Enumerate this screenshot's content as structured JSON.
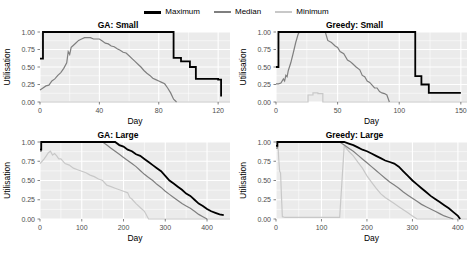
{
  "chart_data": {
    "type": "line",
    "title": "",
    "xlabel": "Day",
    "ylabel": "Utilisation",
    "ylim": [
      0,
      1
    ],
    "yticks": [
      0.0,
      0.25,
      0.5,
      0.75,
      1.0
    ],
    "ytick_labels": [
      "0.00",
      "0.25",
      "0.50",
      "0.75",
      "1.00"
    ],
    "grid": true,
    "legend": {
      "position": "top-center",
      "entries": [
        {
          "name": "Maximum",
          "color": "#000000",
          "width": 1.8
        },
        {
          "name": "Median",
          "color": "#7f7f7f",
          "width": 1.2
        },
        {
          "name": "Minimum",
          "color": "#c8c8c8",
          "width": 1.2
        }
      ]
    },
    "panels": [
      {
        "title": "GA: Small",
        "xlim": [
          0,
          128
        ],
        "xticks": [
          0,
          40,
          80,
          120
        ],
        "xtick_labels": [
          "0",
          "40",
          "80",
          "120"
        ],
        "series": [
          {
            "name": "Maximum",
            "x": [
              0,
              2,
              2,
              90,
              90,
              95,
              95,
              101,
              101,
              105,
              105,
              120,
              120,
              122,
              122
            ],
            "y": [
              0.62,
              0.62,
              1.0,
              1.0,
              0.63,
              0.63,
              0.58,
              0.58,
              0.5,
              0.5,
              0.33,
              0.33,
              0.32,
              0.32,
              0.08
            ]
          },
          {
            "name": "Median",
            "x": [
              0,
              2,
              4,
              6,
              8,
              10,
              12,
              14,
              16,
              18,
              19,
              20,
              21,
              22,
              24,
              26,
              28,
              30,
              32,
              34,
              36,
              38,
              40,
              42,
              44,
              46,
              48,
              50,
              52,
              54,
              56,
              58,
              60,
              62,
              64,
              66,
              68,
              70,
              72,
              74,
              76,
              78,
              80,
              82,
              84,
              86,
              88,
              90,
              92
            ],
            "y": [
              0.17,
              0.2,
              0.23,
              0.24,
              0.3,
              0.33,
              0.38,
              0.42,
              0.48,
              0.56,
              0.72,
              0.68,
              0.78,
              0.8,
              0.84,
              0.88,
              0.9,
              0.92,
              0.92,
              0.92,
              0.9,
              0.9,
              0.9,
              0.87,
              0.84,
              0.83,
              0.8,
              0.79,
              0.76,
              0.74,
              0.71,
              0.7,
              0.66,
              0.62,
              0.58,
              0.54,
              0.5,
              0.45,
              0.41,
              0.38,
              0.34,
              0.32,
              0.3,
              0.28,
              0.26,
              0.2,
              0.13,
              0.04,
              0.0
            ]
          },
          {
            "name": "Minimum",
            "x": [
              0,
              128
            ],
            "y": [
              0.0,
              0.0
            ]
          }
        ]
      },
      {
        "title": "Greedy: Small",
        "xlim": [
          0,
          155
        ],
        "xticks": [
          0,
          50,
          100,
          150
        ],
        "xtick_labels": [
          "0",
          "50",
          "100",
          "150"
        ],
        "series": [
          {
            "name": "Maximum",
            "x": [
              0,
              2,
              2,
              113,
              113,
              118,
              118,
              124,
              124,
              150
            ],
            "y": [
              0.5,
              0.5,
              1.0,
              1.0,
              0.37,
              0.37,
              0.25,
              0.25,
              0.13,
              0.13
            ]
          },
          {
            "name": "Median",
            "x": [
              0,
              2,
              4,
              6,
              7,
              8,
              9,
              10,
              12,
              14,
              16,
              18,
              19,
              40,
              42,
              45,
              48,
              50,
              52,
              55,
              58,
              60,
              62,
              65,
              68,
              70,
              72,
              74,
              76,
              78,
              80,
              82,
              84,
              86,
              88,
              90,
              92
            ],
            "y": [
              0.26,
              0.26,
              0.27,
              0.33,
              0.3,
              0.38,
              0.36,
              0.45,
              0.56,
              0.7,
              0.85,
              0.97,
              1.0,
              1.0,
              0.88,
              0.85,
              0.8,
              0.78,
              0.72,
              0.69,
              0.6,
              0.58,
              0.55,
              0.5,
              0.46,
              0.38,
              0.36,
              0.3,
              0.28,
              0.24,
              0.2,
              0.2,
              0.15,
              0.13,
              0.12,
              0.1,
              0.0
            ]
          },
          {
            "name": "Minimum",
            "x": [
              0,
              26,
              26,
              30,
              30,
              34,
              34,
              38,
              38,
              155
            ],
            "y": [
              0.0,
              0.0,
              0.1,
              0.1,
              0.13,
              0.13,
              0.12,
              0.12,
              0.0,
              0.0
            ]
          }
        ]
      },
      {
        "title": "GA: Large",
        "xlim": [
          0,
          455
        ],
        "xticks": [
          0,
          100,
          200,
          300,
          400
        ],
        "xtick_labels": [
          "0",
          "100",
          "200",
          "300",
          "400"
        ],
        "series": [
          {
            "name": "Maximum",
            "x": [
              0,
              3,
              3,
              180,
              190,
              200,
              210,
              220,
              230,
              240,
              250,
              260,
              270,
              280,
              290,
              300,
              310,
              320,
              330,
              340,
              350,
              360,
              370,
              380,
              390,
              400,
              410,
              420,
              430,
              440
            ],
            "y": [
              0.9,
              0.9,
              1.0,
              1.0,
              0.96,
              0.94,
              0.9,
              0.88,
              0.84,
              0.82,
              0.78,
              0.74,
              0.7,
              0.66,
              0.62,
              0.56,
              0.5,
              0.46,
              0.42,
              0.38,
              0.33,
              0.3,
              0.25,
              0.2,
              0.17,
              0.13,
              0.1,
              0.08,
              0.06,
              0.05
            ]
          },
          {
            "name": "Median",
            "x": [
              0,
              3,
              3,
              150,
              160,
              170,
              180,
              190,
              200,
              210,
              220,
              230,
              240,
              250,
              260,
              270,
              280,
              290,
              300,
              310,
              320,
              330,
              340,
              350,
              360,
              370,
              380,
              390,
              400
            ],
            "y": [
              0.88,
              0.88,
              1.0,
              1.0,
              0.96,
              0.92,
              0.88,
              0.84,
              0.8,
              0.76,
              0.72,
              0.68,
              0.63,
              0.58,
              0.54,
              0.5,
              0.45,
              0.41,
              0.36,
              0.32,
              0.28,
              0.24,
              0.2,
              0.17,
              0.14,
              0.1,
              0.06,
              0.03,
              0.0
            ]
          },
          {
            "name": "Minimum",
            "x": [
              0,
              5,
              10,
              15,
              20,
              25,
              30,
              35,
              40,
              45,
              50,
              60,
              70,
              80,
              90,
              100,
              110,
              120,
              130,
              140,
              150,
              160,
              170,
              180,
              190,
              200,
              210,
              215,
              220,
              230,
              240,
              250,
              260,
              455
            ],
            "y": [
              0.72,
              0.75,
              0.78,
              0.82,
              0.86,
              0.88,
              0.83,
              0.85,
              0.82,
              0.78,
              0.78,
              0.72,
              0.7,
              0.66,
              0.64,
              0.62,
              0.6,
              0.57,
              0.55,
              0.52,
              0.5,
              0.44,
              0.42,
              0.4,
              0.38,
              0.36,
              0.34,
              0.28,
              0.26,
              0.2,
              0.15,
              0.1,
              0.0,
              0.0
            ]
          }
        ]
      },
      {
        "title": "Greedy: Large",
        "xlim": [
          0,
          420
        ],
        "xticks": [
          0,
          100,
          200,
          300,
          400
        ],
        "xtick_labels": [
          "0",
          "100",
          "200",
          "300",
          "400"
        ],
        "series": [
          {
            "name": "Maximum",
            "x": [
              0,
              3,
              3,
              150,
              160,
              170,
              180,
              190,
              200,
              210,
              220,
              230,
              240,
              250,
              260,
              270,
              280,
              290,
              300,
              310,
              320,
              330,
              340,
              350,
              360,
              370,
              380,
              390,
              400,
              405
            ],
            "y": [
              0.95,
              0.95,
              1.0,
              1.0,
              0.98,
              0.96,
              0.93,
              0.9,
              0.88,
              0.85,
              0.82,
              0.79,
              0.76,
              0.74,
              0.72,
              0.68,
              0.62,
              0.56,
              0.5,
              0.45,
              0.4,
              0.35,
              0.3,
              0.26,
              0.22,
              0.18,
              0.14,
              0.09,
              0.04,
              0.0
            ]
          },
          {
            "name": "Median",
            "x": [
              0,
              3,
              3,
              140,
              150,
              160,
              170,
              180,
              190,
              200,
              210,
              220,
              230,
              240,
              250,
              260,
              270,
              280,
              290,
              300,
              310,
              320,
              330,
              340,
              350,
              360,
              370,
              380,
              390
            ],
            "y": [
              0.92,
              0.92,
              1.0,
              1.0,
              0.96,
              0.92,
              0.88,
              0.83,
              0.78,
              0.73,
              0.68,
              0.63,
              0.58,
              0.53,
              0.48,
              0.44,
              0.4,
              0.35,
              0.31,
              0.27,
              0.23,
              0.19,
              0.16,
              0.13,
              0.1,
              0.07,
              0.04,
              0.02,
              0.0
            ]
          },
          {
            "name": "Minimum",
            "x": [
              0,
              4,
              6,
              8,
              10,
              12,
              14,
              20,
              40,
              60,
              80,
              100,
              120,
              140,
              150,
              160,
              170,
              180,
              190,
              200,
              210,
              220,
              230,
              240,
              250,
              260,
              270,
              280,
              290,
              300,
              310,
              420
            ],
            "y": [
              1.0,
              1.0,
              0.78,
              0.62,
              0.6,
              0.3,
              0.03,
              0.02,
              0.02,
              0.02,
              0.02,
              0.02,
              0.02,
              0.02,
              0.95,
              0.88,
              0.82,
              0.74,
              0.66,
              0.56,
              0.48,
              0.4,
              0.33,
              0.28,
              0.24,
              0.2,
              0.16,
              0.12,
              0.08,
              0.04,
              0.0,
              0.0
            ]
          }
        ]
      }
    ]
  }
}
